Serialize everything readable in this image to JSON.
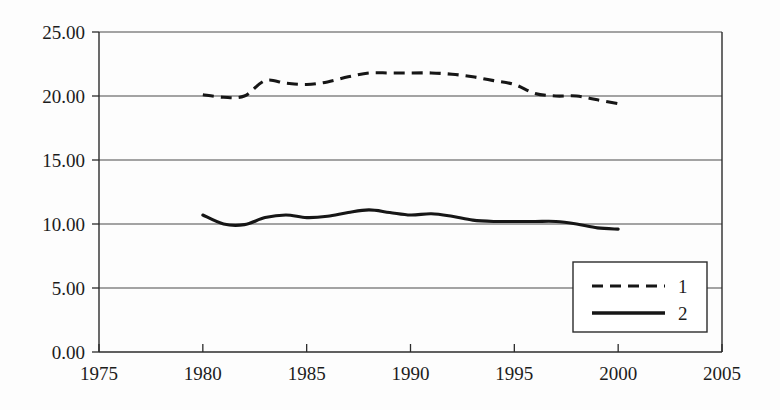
{
  "chart_data": {
    "type": "line",
    "title": "",
    "subtitle": "",
    "xlabel": "",
    "ylabel": "",
    "xlim": [
      1975,
      2005
    ],
    "ylim": [
      0.0,
      25.0
    ],
    "grid": true,
    "grid_axis": "y",
    "legend_position": "bottom-right",
    "x_tick_labels": [
      "1975",
      "1980",
      "1985",
      "1990",
      "1995",
      "2000",
      "2005"
    ],
    "x_ticks": [
      1975,
      1980,
      1985,
      1990,
      1995,
      2000,
      2005
    ],
    "y_tick_labels": [
      "0.00",
      "5.00",
      "10.00",
      "15.00",
      "20.00",
      "25.00"
    ],
    "y_ticks": [
      0,
      5,
      10,
      15,
      20,
      25
    ],
    "x": [
      1980,
      1981,
      1982,
      1983,
      1984,
      1985,
      1986,
      1987,
      1988,
      1989,
      1990,
      1991,
      1992,
      1993,
      1994,
      1995,
      1996,
      1997,
      1998,
      1999,
      2000
    ],
    "series": [
      {
        "name": "1",
        "style": "dashed",
        "color": "#161616",
        "values": [
          20.1,
          19.9,
          20.0,
          21.2,
          21.0,
          20.9,
          21.1,
          21.5,
          21.8,
          21.8,
          21.8,
          21.8,
          21.7,
          21.5,
          21.2,
          20.9,
          20.2,
          20.0,
          20.0,
          19.7,
          19.4
        ]
      },
      {
        "name": "2",
        "style": "solid",
        "color": "#161616",
        "values": [
          10.7,
          10.0,
          9.95,
          10.5,
          10.7,
          10.5,
          10.6,
          10.9,
          11.1,
          10.9,
          10.7,
          10.8,
          10.6,
          10.3,
          10.2,
          10.2,
          10.2,
          10.2,
          10.0,
          9.7,
          9.6
        ]
      }
    ],
    "legend_entries": [
      {
        "label": "1",
        "style": "dashed"
      },
      {
        "label": "2",
        "style": "solid"
      }
    ]
  }
}
